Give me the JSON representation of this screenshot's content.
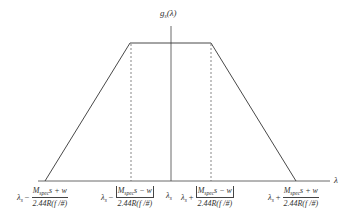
{
  "figure": {
    "y_axis_label": "g_s(λ)",
    "y_axis_label_main": "g",
    "y_axis_label_sub": "s",
    "y_axis_label_arg": "(λ)",
    "x_axis_label": "λ",
    "shape": "trapezoid",
    "line_color": "#333333",
    "dashed_color": "#555555"
  },
  "ticks": [
    {
      "id": "outer-left",
      "lambda": "λ",
      "lambda_sub": "s",
      "op": "−",
      "num_main": "M",
      "num_sub": "spec",
      "num_rest": "s + w",
      "absolute": false,
      "den": "2.44R(f /#)"
    },
    {
      "id": "inner-left",
      "lambda": "λ",
      "lambda_sub": "s",
      "op": "−",
      "num_main": "M",
      "num_sub": "spec",
      "num_rest": "s − w",
      "absolute": true,
      "den": "2.44R(f /#)"
    },
    {
      "id": "center",
      "lambda": "λ",
      "lambda_sub": "s"
    },
    {
      "id": "inner-right",
      "lambda": "λ",
      "lambda_sub": "s",
      "op": "+",
      "num_main": "M",
      "num_sub": "spec",
      "num_rest": "s − w",
      "absolute": true,
      "den": "2.44R(f /#)"
    },
    {
      "id": "outer-right",
      "lambda": "λ",
      "lambda_sub": "s",
      "op": "+",
      "num_main": "M",
      "num_sub": "spec",
      "num_rest": "s + w",
      "absolute": false,
      "den": "2.44R(f /#)"
    }
  ]
}
